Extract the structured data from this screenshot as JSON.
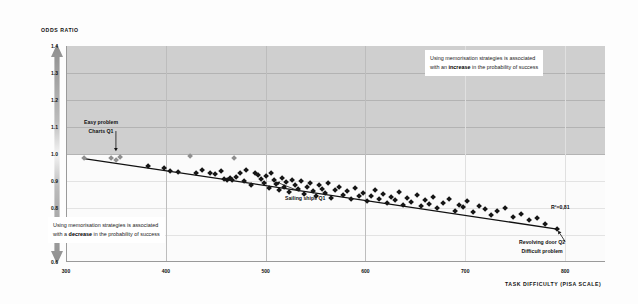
{
  "axes": {
    "y_title": "ODDS RATIO",
    "x_title": "TASK DIFFICULTY (PISA SCALE)",
    "y_ticks": [
      "1.4",
      "1.3",
      "1.2",
      "1.1",
      "1.0",
      "0.9",
      "0.8",
      "0.7",
      "0.6"
    ],
    "x_ticks": [
      "300",
      "400",
      "500",
      "600",
      "700",
      "800"
    ]
  },
  "annotations": {
    "increase_line1": "Using memorisation strategies is associated",
    "increase_line2_pre": "with an ",
    "increase_line2_bold": "increase",
    "increase_line2_post": " in the probability of success",
    "decrease_line1": "Using memorisation strategies is associated",
    "decrease_line2_pre": "with a ",
    "decrease_line2_bold": "decrease",
    "decrease_line2_post": " in the probability of success",
    "easy_line1": "Easy problem",
    "easy_line2": "Charts Q1",
    "sailing": "Sailing ships Q1",
    "revolving_line1": "Revolving door Q2",
    "revolving_line2": "Difficult problem",
    "r_squared": "R²=0,81"
  },
  "colors": {
    "band_above_one": "#cfcfcf",
    "band_below_one": "#fbfbfb",
    "marker_dark": "#161616",
    "marker_grey": "#8f8f8f",
    "trend_line": "#111111"
  },
  "chart_data": {
    "type": "scatter",
    "title": "",
    "xlabel": "TASK DIFFICULTY (PISA SCALE)",
    "ylabel": "ODDS RATIO",
    "xlim": [
      300,
      840
    ],
    "ylim": [
      0.6,
      1.4
    ],
    "grid": true,
    "legend": "none",
    "reference_line_y": 1.0,
    "r_squared": 0.81,
    "trend_line": {
      "type": "linear_fit",
      "x_start": 318,
      "y_start": 0.983,
      "x_end": 792,
      "y_end": 0.722
    },
    "series": [
      {
        "name": "Grey diamonds",
        "color": "#8f8f8f",
        "points": [
          [
            318,
            0.983
          ],
          [
            345,
            0.985
          ],
          [
            350,
            0.978
          ],
          [
            354,
            0.99
          ],
          [
            424,
            0.993
          ],
          [
            468,
            0.985
          ]
        ]
      },
      {
        "name": "Black diamonds",
        "color": "#161616",
        "points": [
          [
            382,
            0.957
          ],
          [
            398,
            0.949
          ],
          [
            404,
            0.935
          ],
          [
            412,
            0.933
          ],
          [
            430,
            0.93
          ],
          [
            436,
            0.94
          ],
          [
            444,
            0.929
          ],
          [
            449,
            0.924
          ],
          [
            455,
            0.938
          ],
          [
            458,
            0.906
          ],
          [
            461,
            0.903
          ],
          [
            464,
            0.911
          ],
          [
            466,
            0.902
          ],
          [
            470,
            0.915
          ],
          [
            474,
            0.928
          ],
          [
            478,
            0.898
          ],
          [
            480,
            0.942
          ],
          [
            485,
            0.885
          ],
          [
            489,
            0.93
          ],
          [
            492,
            0.921
          ],
          [
            495,
            0.906
          ],
          [
            498,
            0.893
          ],
          [
            500,
            0.918
          ],
          [
            503,
            0.875
          ],
          [
            505,
            0.93
          ],
          [
            508,
            0.902
          ],
          [
            510,
            0.889
          ],
          [
            513,
            0.866
          ],
          [
            516,
            0.912
          ],
          [
            518,
            0.878
          ],
          [
            521,
            0.896
          ],
          [
            524,
            0.858
          ],
          [
            527,
            0.905
          ],
          [
            530,
            0.884
          ],
          [
            533,
            0.869
          ],
          [
            536,
            0.898
          ],
          [
            539,
            0.852
          ],
          [
            542,
            0.876
          ],
          [
            545,
            0.891
          ],
          [
            548,
            0.862
          ],
          [
            551,
            0.845
          ],
          [
            554,
            0.883
          ],
          [
            557,
            0.871
          ],
          [
            560,
            0.856
          ],
          [
            563,
            0.894
          ],
          [
            566,
            0.838
          ],
          [
            570,
            0.866
          ],
          [
            574,
            0.879
          ],
          [
            578,
            0.849
          ],
          [
            582,
            0.861
          ],
          [
            586,
            0.833
          ],
          [
            590,
            0.872
          ],
          [
            594,
            0.845
          ],
          [
            598,
            0.857
          ],
          [
            602,
            0.826
          ],
          [
            606,
            0.843
          ],
          [
            610,
            0.866
          ],
          [
            614,
            0.834
          ],
          [
            618,
            0.852
          ],
          [
            622,
            0.818
          ],
          [
            626,
            0.84
          ],
          [
            630,
            0.829
          ],
          [
            634,
            0.858
          ],
          [
            638,
            0.812
          ],
          [
            642,
            0.836
          ],
          [
            646,
            0.823
          ],
          [
            652,
            0.847
          ],
          [
            656,
            0.806
          ],
          [
            660,
            0.828
          ],
          [
            664,
            0.815
          ],
          [
            668,
            0.842
          ],
          [
            672,
            0.798
          ],
          [
            678,
            0.82
          ],
          [
            684,
            0.833
          ],
          [
            690,
            0.789
          ],
          [
            694,
            0.812
          ],
          [
            698,
            0.802
          ],
          [
            702,
            0.826
          ],
          [
            708,
            0.784
          ],
          [
            714,
            0.808
          ],
          [
            720,
            0.795
          ],
          [
            726,
            0.772
          ],
          [
            732,
            0.788
          ],
          [
            740,
            0.801
          ],
          [
            748,
            0.768
          ],
          [
            756,
            0.779
          ],
          [
            764,
            0.755
          ],
          [
            772,
            0.762
          ],
          [
            780,
            0.741
          ],
          [
            792,
            0.722
          ]
        ]
      }
    ],
    "labeled_points": [
      {
        "label": "Easy problem / Charts Q1",
        "x": 350,
        "y": 0.985
      },
      {
        "label": "Sailing ships Q1",
        "x": 508,
        "y": 0.902
      },
      {
        "label": "Revolving door Q2 / Difficult problem",
        "x": 792,
        "y": 0.722
      }
    ]
  }
}
